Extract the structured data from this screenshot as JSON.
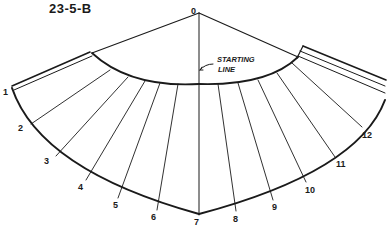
{
  "figure": {
    "id_label": "23-5-B",
    "apex_label": "0",
    "annotation": [
      "STARTING",
      "LINE"
    ],
    "division_labels": [
      "1",
      "2",
      "3",
      "4",
      "5",
      "6",
      "7",
      "8",
      "9",
      "10",
      "11",
      "12"
    ]
  }
}
